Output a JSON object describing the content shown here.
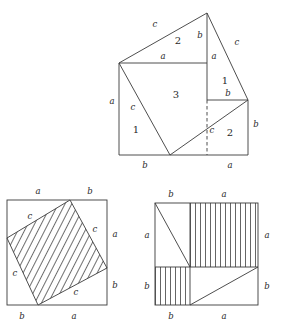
{
  "figure": {
    "stroke_color": "#3a3a3a",
    "text_color": "#2a2a2a",
    "background": "#ffffff"
  },
  "top_figure": {
    "name": "dissection-rearrangement",
    "piece_numbers": [
      "1",
      "2",
      "3",
      "1",
      "2"
    ],
    "labels": {
      "upper_left_c": "c",
      "upper_mid_two": "2",
      "apex_b": "b",
      "upper_right_c": "c",
      "inner_a_top": "a",
      "inner_a_right": "a",
      "piece_one_right": "1",
      "left_a": "a",
      "inner_c": "c",
      "center_three": "3",
      "piece_one_left": "1",
      "right_b_upper": "b",
      "lower_c": "c",
      "lower_two": "2",
      "right_b_lower": "b",
      "bottom_b": "b",
      "bottom_a": "a"
    }
  },
  "bottom_left_figure": {
    "name": "tilted-square-c-squared",
    "hatch": "diagonal",
    "labels": {
      "top_a": "a",
      "top_b": "b",
      "right_a": "a",
      "right_b": "b",
      "bottom_b": "b",
      "bottom_a": "a",
      "c_upper_left": "c",
      "c_upper_right": "c",
      "c_lower_left": "c",
      "c_lower_right": "c"
    }
  },
  "bottom_right_figure": {
    "name": "squares-a-squared-b-squared",
    "hatch": "vertical",
    "labels": {
      "top_b": "b",
      "top_a": "a",
      "left_a": "a",
      "left_b": "b",
      "right_a": "a",
      "right_b": "b",
      "bottom_b": "b",
      "bottom_a": "a"
    }
  }
}
